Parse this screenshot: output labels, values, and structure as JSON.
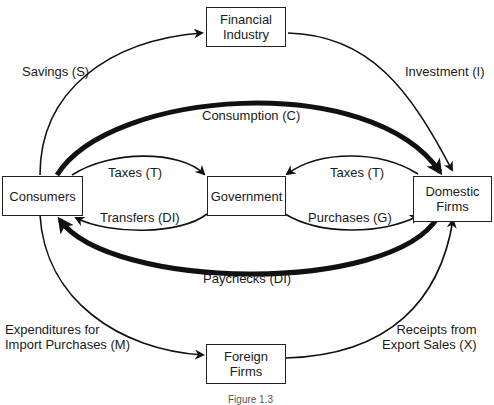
{
  "nodes": {
    "financial": "Financial\nIndustry",
    "consumers": "Consumers",
    "government": "Government",
    "domestic": "Domestic\nFirms",
    "foreign": "Foreign\nFirms"
  },
  "flows": {
    "savings": "Savings (S)",
    "investment": "Investment (I)",
    "consumption": "Consumption (C)",
    "taxes_consumers": "Taxes (T)",
    "taxes_firms": "Taxes (T)",
    "transfers": "Transfers (DI)",
    "purchases": "Purchases (G)",
    "paychecks": "Paychecks (DI)",
    "imports": "Expenditures for\nImport Purchases (M)",
    "exports": "Receipts from\nExport Sales (X)"
  },
  "caption": "Figure 1.3"
}
